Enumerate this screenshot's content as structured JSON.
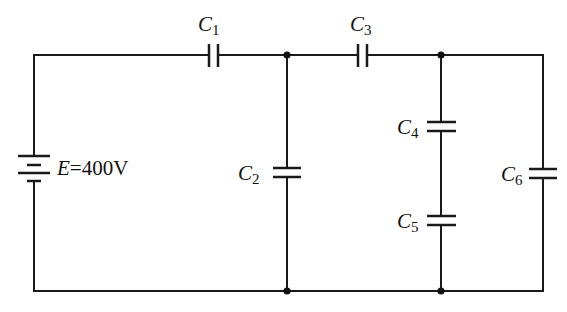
{
  "diagram": {
    "type": "circuit",
    "wire_color": "#1a1a1a",
    "source": {
      "symbol": "E",
      "equals": "=",
      "value": "400 V",
      "value_text": "400V"
    },
    "capacitors": [
      {
        "id": "C1",
        "letter": "C",
        "index": "1",
        "orientation": "vertical-plates",
        "position": "top wire, left"
      },
      {
        "id": "C2",
        "letter": "C",
        "index": "2",
        "orientation": "horizontal-plates",
        "position": "middle branch"
      },
      {
        "id": "C3",
        "letter": "C",
        "index": "3",
        "orientation": "vertical-plates",
        "position": "top wire, right"
      },
      {
        "id": "C4",
        "letter": "C",
        "index": "4",
        "orientation": "horizontal-plates",
        "position": "right-middle branch, upper"
      },
      {
        "id": "C5",
        "letter": "C",
        "index": "5",
        "orientation": "horizontal-plates",
        "position": "right-middle branch, lower"
      },
      {
        "id": "C6",
        "letter": "C",
        "index": "6",
        "orientation": "horizontal-plates",
        "position": "rightmost branch"
      }
    ],
    "junctions": 4
  }
}
